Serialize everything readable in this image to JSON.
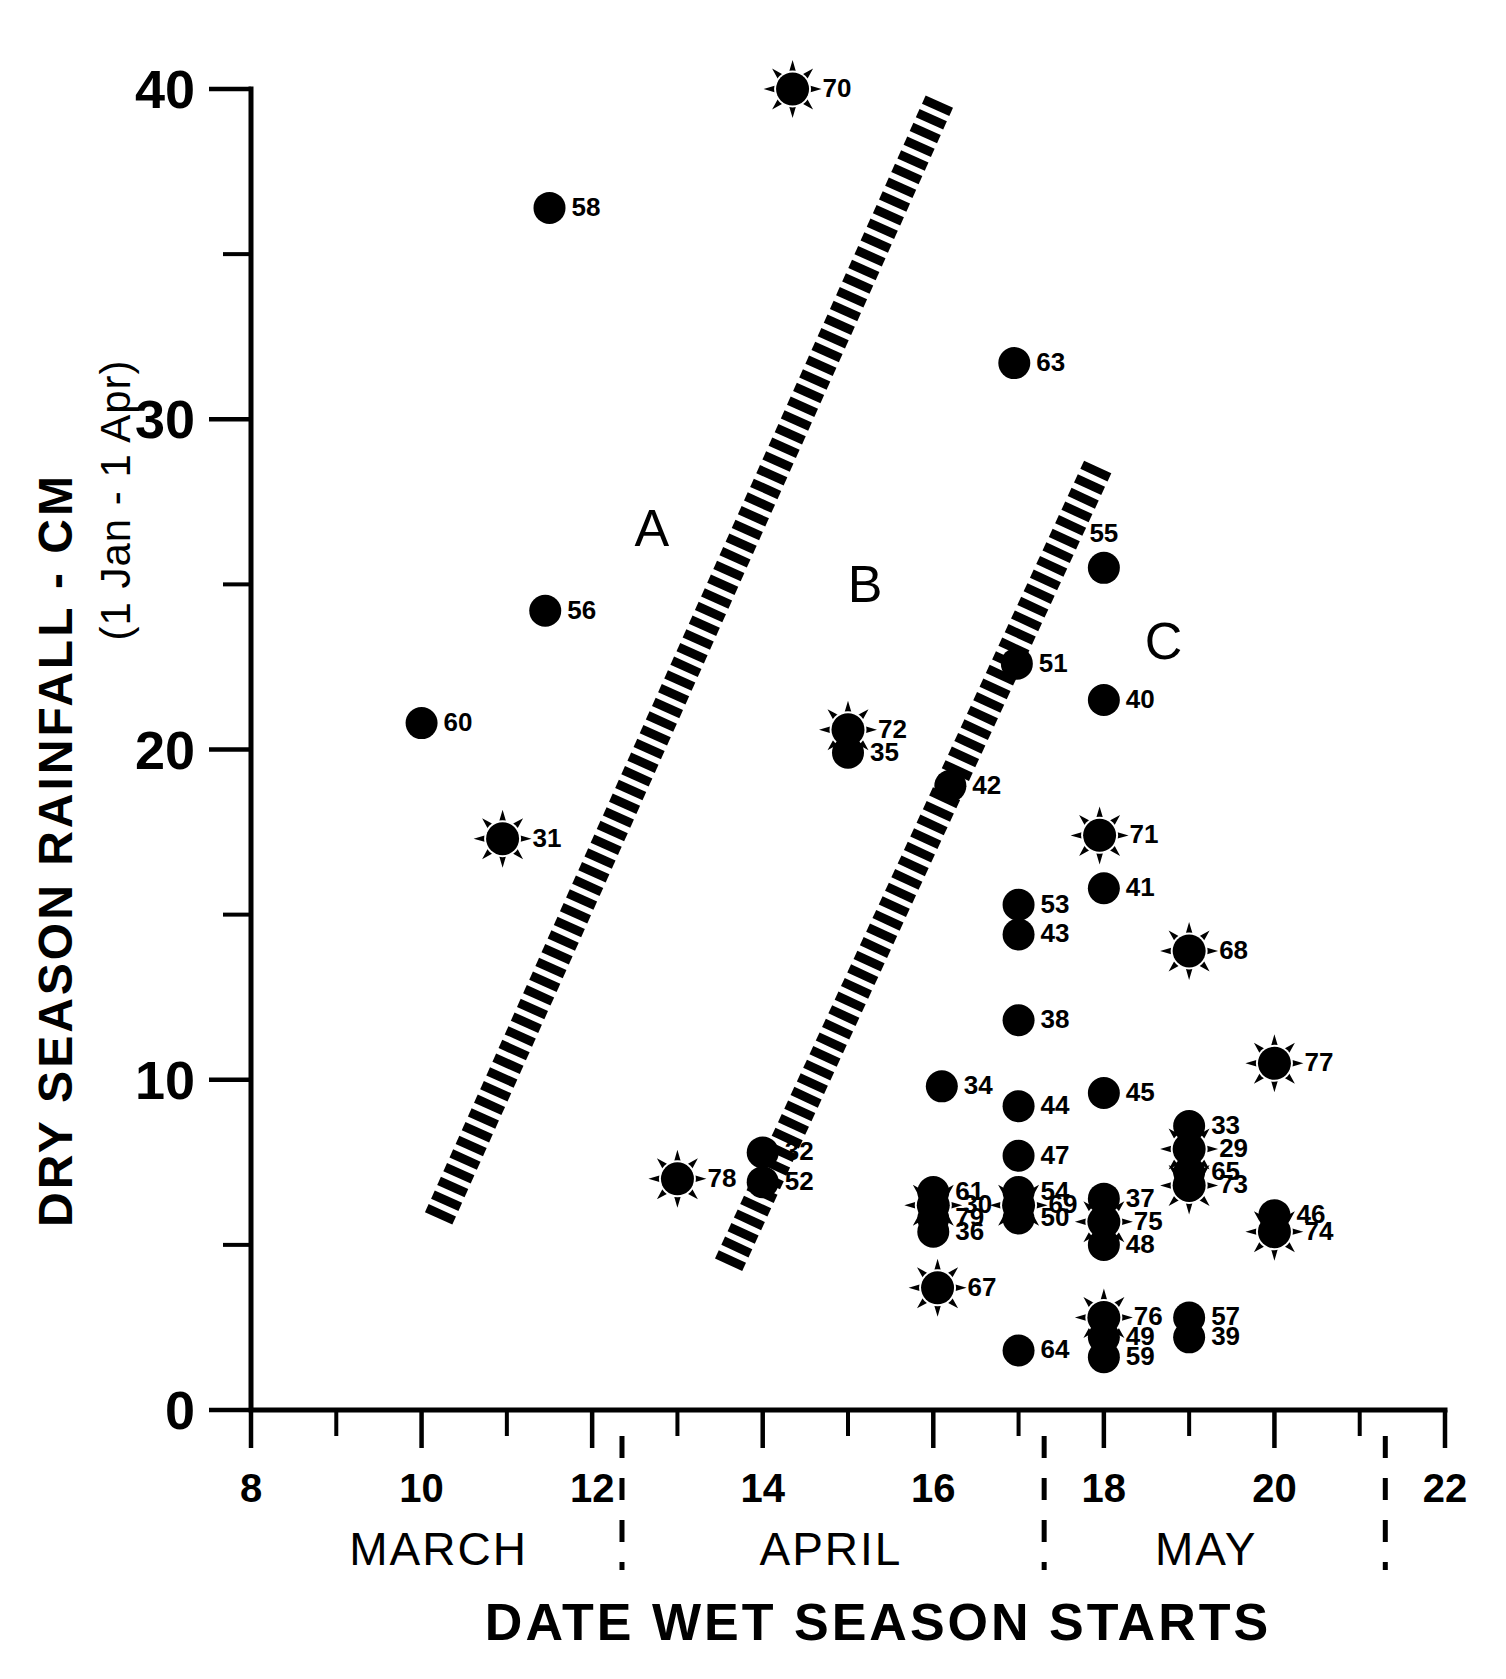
{
  "chart_data": {
    "type": "scatter",
    "title": "",
    "xlabel": "DATE WET SEASON STARTS",
    "ylabel": "DRY SEASON RAINFALL - CM",
    "ylabel_sub": "(1 Jan - 1 Apr)",
    "xlim": [
      8,
      22
    ],
    "ylim": [
      0,
      40
    ],
    "xticks": [
      8,
      10,
      12,
      14,
      16,
      18,
      20,
      22
    ],
    "xtick_labels": [
      "8",
      "10",
      "12",
      "14",
      "16",
      "18",
      "20",
      "22"
    ],
    "xticks_minor": [
      9,
      11,
      13,
      15,
      17,
      19,
      21
    ],
    "yticks": [
      0,
      10,
      20,
      30,
      40
    ],
    "ytick_labels": [
      "0",
      "10",
      "20",
      "30",
      "40"
    ],
    "yticks_minor": [
      5,
      15,
      25,
      35
    ],
    "grid": false,
    "legend": "none",
    "month_bands": [
      {
        "name": "MARCH",
        "center_x": 10.2,
        "end_x": 12.35
      },
      {
        "name": "APRIL",
        "center_x": 14.8,
        "end_x": 17.3
      },
      {
        "name": "MAY",
        "center_x": 19.2,
        "end_x": 21.3
      }
    ],
    "zone_labels": [
      {
        "text": "A",
        "x": 12.7,
        "y": 26.7
      },
      {
        "text": "B",
        "x": 15.2,
        "y": 25.0
      },
      {
        "text": "C",
        "x": 18.7,
        "y": 23.3
      },
      {
        "text": "D",
        "x": 0,
        "y": 0
      }
    ],
    "divider_bands": [
      {
        "name": "band-a-b",
        "x1": 10.2,
        "y1": 5.8,
        "x2": 16.05,
        "y2": 39.5
      },
      {
        "name": "band-b-c",
        "x1": 13.6,
        "y1": 4.4,
        "x2": 17.9,
        "y2": 28.4
      }
    ],
    "marker_types": {
      "dot": "filled-circle",
      "star": "filled-circle-with-spikes"
    },
    "points": [
      {
        "id": "70",
        "x": 14.35,
        "y": 40.0,
        "marker": "star",
        "label_pos": "right"
      },
      {
        "id": "58",
        "x": 11.5,
        "y": 36.4,
        "marker": "dot",
        "label_pos": "right"
      },
      {
        "id": "63",
        "x": 16.95,
        "y": 31.7,
        "marker": "dot",
        "label_pos": "right"
      },
      {
        "id": "55",
        "x": 18.0,
        "y": 25.5,
        "marker": "dot",
        "label_pos": "above"
      },
      {
        "id": "56",
        "x": 11.45,
        "y": 24.2,
        "marker": "dot",
        "label_pos": "right"
      },
      {
        "id": "51",
        "x": 16.98,
        "y": 22.6,
        "marker": "dot",
        "label_pos": "right"
      },
      {
        "id": "40",
        "x": 18.0,
        "y": 21.5,
        "marker": "dot",
        "label_pos": "right"
      },
      {
        "id": "60",
        "x": 10.0,
        "y": 20.8,
        "marker": "dot",
        "label_pos": "right"
      },
      {
        "id": "72",
        "x": 15.0,
        "y": 20.6,
        "marker": "star",
        "label_pos": "right"
      },
      {
        "id": "35",
        "x": 15.0,
        "y": 19.9,
        "marker": "dot",
        "label_pos": "right"
      },
      {
        "id": "42",
        "x": 16.2,
        "y": 18.9,
        "marker": "dot",
        "label_pos": "right"
      },
      {
        "id": "71",
        "x": 17.95,
        "y": 17.4,
        "marker": "star",
        "label_pos": "right"
      },
      {
        "id": "31",
        "x": 10.95,
        "y": 17.3,
        "marker": "star",
        "label_pos": "right"
      },
      {
        "id": "41",
        "x": 18.0,
        "y": 15.8,
        "marker": "dot",
        "label_pos": "right"
      },
      {
        "id": "53",
        "x": 17.0,
        "y": 15.3,
        "marker": "dot",
        "label_pos": "right"
      },
      {
        "id": "43",
        "x": 17.0,
        "y": 14.4,
        "marker": "dot",
        "label_pos": "right"
      },
      {
        "id": "68",
        "x": 19.0,
        "y": 13.9,
        "marker": "star",
        "label_pos": "right"
      },
      {
        "id": "38",
        "x": 17.0,
        "y": 11.8,
        "marker": "dot",
        "label_pos": "right"
      },
      {
        "id": "77",
        "x": 20.0,
        "y": 10.5,
        "marker": "star",
        "label_pos": "right"
      },
      {
        "id": "34",
        "x": 16.1,
        "y": 9.8,
        "marker": "dot",
        "label_pos": "right"
      },
      {
        "id": "45",
        "x": 18.0,
        "y": 9.6,
        "marker": "dot",
        "label_pos": "right"
      },
      {
        "id": "44",
        "x": 17.0,
        "y": 9.2,
        "marker": "dot",
        "label_pos": "right"
      },
      {
        "id": "33",
        "x": 19.0,
        "y": 8.6,
        "marker": "dot",
        "label_pos": "right"
      },
      {
        "id": "29",
        "x": 19.0,
        "y": 7.9,
        "marker": "star",
        "label_pos": "right"
      },
      {
        "id": "32",
        "x": 14.0,
        "y": 7.8,
        "marker": "dot",
        "label_pos": "right"
      },
      {
        "id": "47",
        "x": 17.0,
        "y": 7.7,
        "marker": "dot",
        "label_pos": "right"
      },
      {
        "id": "65",
        "x": 19.0,
        "y": 7.2,
        "marker": "dot",
        "label_pos": "right"
      },
      {
        "id": "73",
        "x": 19.0,
        "y": 6.8,
        "marker": "star",
        "label_pos": "right"
      },
      {
        "id": "78",
        "x": 13.0,
        "y": 7.0,
        "marker": "star",
        "label_pos": "right"
      },
      {
        "id": "52",
        "x": 14.0,
        "y": 6.9,
        "marker": "dot",
        "label_pos": "right"
      },
      {
        "id": "61",
        "x": 16.0,
        "y": 6.6,
        "marker": "dot",
        "label_pos": "right"
      },
      {
        "id": "54",
        "x": 17.0,
        "y": 6.6,
        "marker": "dot",
        "label_pos": "right"
      },
      {
        "id": "30",
        "x": 16.0,
        "y": 6.2,
        "marker": "star",
        "label_pos": "right"
      },
      {
        "id": "69",
        "x": 17.0,
        "y": 6.2,
        "marker": "star",
        "label_pos": "right"
      },
      {
        "id": "37",
        "x": 18.0,
        "y": 6.4,
        "marker": "dot",
        "label_pos": "right"
      },
      {
        "id": "79",
        "x": 16.0,
        "y": 5.8,
        "marker": "dot",
        "label_pos": "right"
      },
      {
        "id": "50",
        "x": 17.0,
        "y": 5.8,
        "marker": "dot",
        "label_pos": "right"
      },
      {
        "id": "75",
        "x": 18.0,
        "y": 5.7,
        "marker": "star",
        "label_pos": "right"
      },
      {
        "id": "46",
        "x": 20.0,
        "y": 5.9,
        "marker": "dot",
        "label_pos": "right"
      },
      {
        "id": "74",
        "x": 20.0,
        "y": 5.4,
        "marker": "star",
        "label_pos": "right"
      },
      {
        "id": "36",
        "x": 16.0,
        "y": 5.4,
        "marker": "dot",
        "label_pos": "right"
      },
      {
        "id": "48",
        "x": 18.0,
        "y": 5.0,
        "marker": "dot",
        "label_pos": "right"
      },
      {
        "id": "67",
        "x": 16.05,
        "y": 3.7,
        "marker": "star",
        "label_pos": "right"
      },
      {
        "id": "76",
        "x": 18.0,
        "y": 2.8,
        "marker": "star",
        "label_pos": "right"
      },
      {
        "id": "57",
        "x": 19.0,
        "y": 2.8,
        "marker": "dot",
        "label_pos": "right"
      },
      {
        "id": "49",
        "x": 18.0,
        "y": 2.2,
        "marker": "dot",
        "label_pos": "right"
      },
      {
        "id": "39",
        "x": 19.0,
        "y": 2.2,
        "marker": "dot",
        "label_pos": "right"
      },
      {
        "id": "64",
        "x": 17.0,
        "y": 1.8,
        "marker": "dot",
        "label_pos": "right"
      },
      {
        "id": "59",
        "x": 18.0,
        "y": 1.6,
        "marker": "dot",
        "label_pos": "right"
      }
    ]
  },
  "colors": {
    "ink": "#000000",
    "background": "#ffffff"
  }
}
